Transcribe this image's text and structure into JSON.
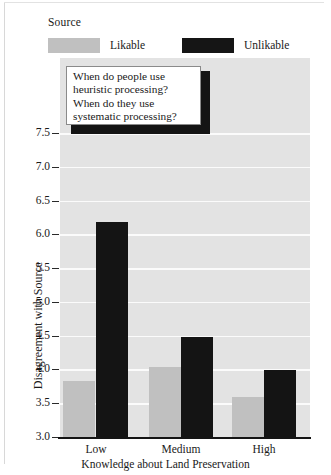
{
  "legend": {
    "title": "Source",
    "entries": [
      {
        "label": "Likable",
        "color": "#c0c0c0"
      },
      {
        "label": "Unlikable",
        "color": "#141414"
      }
    ]
  },
  "callout": {
    "lines": [
      "When do people use",
      "heuristic processing?",
      "When do they use",
      "systematic processing?"
    ]
  },
  "axes": {
    "ylabel": "Disagreement with Source",
    "xlabel": "Knowledge about Land Preservation",
    "yticks": [
      "7.5",
      "7.0",
      "6.5",
      "6.0",
      "5.5",
      "5.0",
      "4.5",
      "4.0",
      "3.5",
      "3.0"
    ],
    "xticks": [
      "Low",
      "Medium",
      "High"
    ]
  },
  "chart_data": {
    "type": "bar",
    "title": "",
    "xlabel": "Knowledge about Land Preservation",
    "ylabel": "Disagreement with Source",
    "categories": [
      "Low",
      "Medium",
      "High"
    ],
    "series": [
      {
        "name": "Likable",
        "color": "#c0c0c0",
        "values": [
          3.85,
          4.05,
          3.6
        ]
      },
      {
        "name": "Unlikable",
        "color": "#141414",
        "values": [
          6.2,
          4.5,
          4.0
        ]
      }
    ],
    "ylim": [
      3.0,
      7.5
    ],
    "ytick_step": 0.5,
    "grid": true,
    "grid_color": "#fbfbfb",
    "panel_background": "#e3e3e3",
    "legend_position": "top",
    "legend_title": "Source",
    "annotations": [
      "When do people use heuristic processing? When do they use systematic processing?"
    ]
  }
}
